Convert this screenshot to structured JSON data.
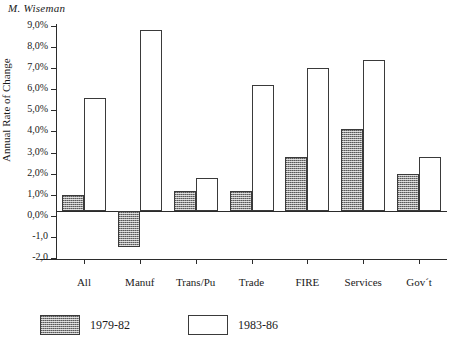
{
  "running_head": "M. Wiseman",
  "chart_data": {
    "type": "bar",
    "title": "M. Wiseman",
    "xlabel": "",
    "ylabel": "Annual Rate of Change",
    "categories": [
      "All",
      "Manuf",
      "Trans/Pu",
      "Trade",
      "FIRE",
      "Services",
      "Gov´t"
    ],
    "series": [
      {
        "name": "1979-82",
        "values": [
          1.0,
          -1.5,
          1.2,
          1.2,
          2.8,
          4.1,
          2.0
        ]
      },
      {
        "name": "1983-86",
        "values": [
          5.6,
          8.8,
          1.8,
          6.2,
          7.0,
          7.4,
          2.8
        ]
      }
    ],
    "ylim": [
      -2.0,
      9.0
    ],
    "ytick_values": [
      9.0,
      8.0,
      7.0,
      6.0,
      5.0,
      4.0,
      3.0,
      2.0,
      1.0,
      0.0,
      -1.0,
      -2.0
    ],
    "ytick_labels": [
      "9,0%",
      "8,0%",
      "7,0%",
      "6,0%",
      "5,0%",
      "4,0%",
      "3,0%",
      "2,0%",
      "1,0%",
      "0,0%",
      "-1,0",
      "-2,0"
    ],
    "grid": false,
    "legend_position": "bottom-left",
    "colors": {
      "series_1979_82": "#8f8f8f",
      "series_1983_86": "#ffffff",
      "axis": "#2b2b2b",
      "bar_outline": "#3a3a3a"
    }
  },
  "legend": {
    "entries": [
      {
        "label": "1979-82"
      },
      {
        "label": "1983-86"
      }
    ]
  }
}
